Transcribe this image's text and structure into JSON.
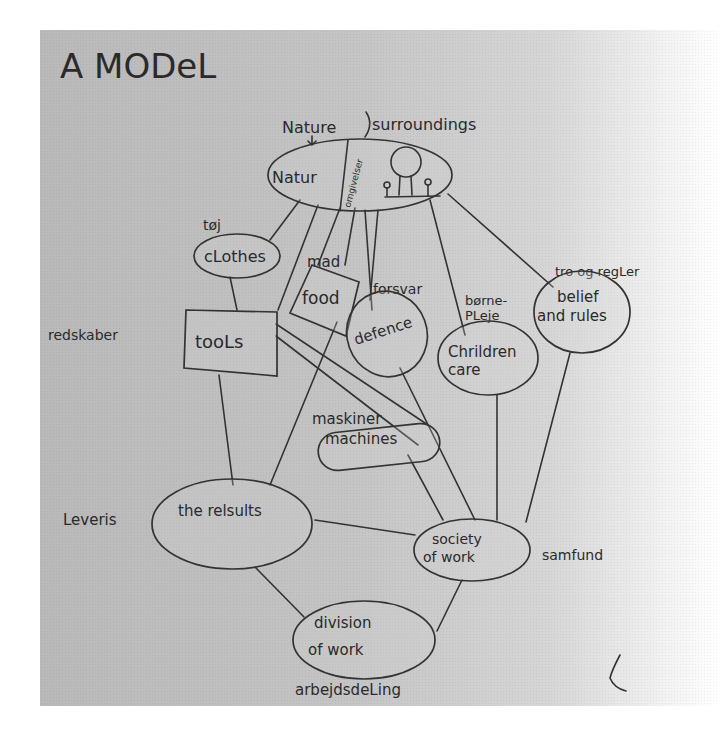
{
  "title": "A MODeL",
  "colors": {
    "paper": "#c2c2c2",
    "ink": "#2a2a2a",
    "background": "#ffffff"
  },
  "annotations": {
    "nature_header": "Nature",
    "surroundings_header": "surroundings",
    "omgivelser": "omgivelser",
    "toj": "tøj",
    "mad": "mad",
    "forsvar": "forsvar",
    "borne_pleje_1": "børne-",
    "borne_pleje_2": "PLeje",
    "tro_og_regler": "tro og regLer",
    "redskaber": "redskaber",
    "maskiner": "maskiner",
    "leveris": "Leveris",
    "samfund": "samfund",
    "arbejdsdeling": "arbejdsdeLing"
  },
  "nodes": {
    "nature": {
      "label": "Natur",
      "shape": "ellipse"
    },
    "clothes": {
      "label": "cLothes",
      "shape": "ellipse"
    },
    "food": {
      "label": "food",
      "shape": "rectangle"
    },
    "tools": {
      "label": "tooLs",
      "shape": "rectangle"
    },
    "defence": {
      "label": "defence",
      "shape": "ellipse"
    },
    "children_care": {
      "line1": "Chrildren",
      "line2": "care",
      "shape": "ellipse"
    },
    "belief_rules": {
      "line1": "belief",
      "line2": "and rules",
      "shape": "ellipse"
    },
    "machines": {
      "label": "machines",
      "shape": "rounded"
    },
    "results": {
      "label": "the relsults",
      "shape": "ellipse"
    },
    "society_work": {
      "line1": "society",
      "line2": "of work",
      "shape": "ellipse"
    },
    "division_work": {
      "line1": "division",
      "line2": "of work",
      "shape": "ellipse"
    }
  },
  "edges": [
    [
      "nature",
      "clothes"
    ],
    [
      "nature",
      "tools"
    ],
    [
      "nature",
      "food"
    ],
    [
      "nature",
      "defence"
    ],
    [
      "nature",
      "children_care"
    ],
    [
      "nature",
      "belief_rules"
    ],
    [
      "clothes",
      "tools"
    ],
    [
      "tools",
      "results"
    ],
    [
      "tools",
      "machines"
    ],
    [
      "food",
      "results"
    ],
    [
      "defence",
      "society_work"
    ],
    [
      "children_care",
      "society_work"
    ],
    [
      "belief_rules",
      "society_work"
    ],
    [
      "machines",
      "society_work"
    ],
    [
      "results",
      "society_work"
    ],
    [
      "results",
      "division_work"
    ],
    [
      "society_work",
      "division_work"
    ]
  ]
}
